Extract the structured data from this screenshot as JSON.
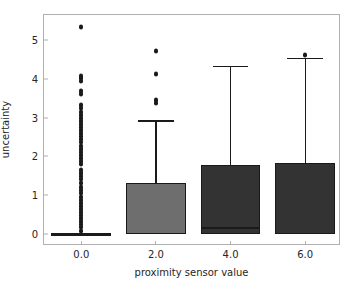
{
  "chart_data": {
    "type": "box",
    "title": "",
    "xlabel": "proximity sensor value",
    "ylabel": "uncertainty",
    "categories": [
      "0.0",
      "2.0",
      "4.0",
      "6.0"
    ],
    "xticklabels": [
      "0.0",
      "2.0",
      "4.0",
      "6.0"
    ],
    "yticklabels": [
      "0",
      "1",
      "2",
      "3",
      "4",
      "5"
    ],
    "ytickvalues": [
      0,
      1,
      2,
      3,
      4,
      5
    ],
    "xlim": [
      -1.0,
      6.96
    ],
    "ylim": [
      -0.32,
      5.66
    ],
    "grid": false,
    "legend": false,
    "boxes": [
      {
        "category": "0.0",
        "x": 0.0,
        "fill": "#ffffff",
        "q1": 0.0,
        "median": 0.0,
        "q3": 0.0,
        "whisker_low": 0.0,
        "whisker_high": 0.0,
        "fliers": [
          5.35,
          4.08,
          4.02,
          3.96,
          3.68,
          3.62,
          3.32,
          3.24,
          3.16,
          3.08,
          3.0,
          2.92,
          2.84,
          2.76,
          2.68,
          2.6,
          2.52,
          2.44,
          2.36,
          2.28,
          2.2,
          2.12,
          2.04,
          1.96,
          1.88,
          1.8,
          1.66,
          1.58,
          1.5,
          1.42,
          1.3,
          1.2,
          1.12,
          1.04,
          0.96,
          0.88,
          0.8,
          0.72,
          0.64,
          0.56,
          0.48,
          0.4,
          0.32,
          0.24,
          0.16,
          0.08
        ]
      },
      {
        "category": "2.0",
        "x": 2.0,
        "fill": "#6e6e6e",
        "q1": 0.0,
        "median": 0.0,
        "q3": 1.32,
        "whisker_low": 0.0,
        "whisker_high": 2.92,
        "fliers": [
          4.73,
          4.13,
          3.45,
          3.37
        ]
      },
      {
        "category": "4.0",
        "x": 4.0,
        "fill": "#333333",
        "q1": 0.0,
        "median": 0.15,
        "q3": 1.78,
        "whisker_low": 0.0,
        "whisker_high": 4.33,
        "fliers": []
      },
      {
        "category": "6.0",
        "x": 6.0,
        "fill": "#333333",
        "q1": 0.0,
        "median": 0.0,
        "q3": 1.82,
        "whisker_low": 0.0,
        "whisker_high": 4.53,
        "fliers": [
          4.62
        ]
      }
    ]
  }
}
